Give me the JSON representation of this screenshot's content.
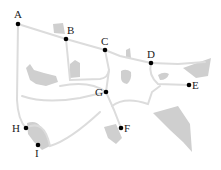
{
  "diagram": {
    "type": "road-network-map",
    "colors": {
      "road": "#dcdcdc",
      "region": "#cfcfcf",
      "node": "#000000",
      "label": "#222222",
      "background": "#ffffff"
    },
    "nodes": [
      {
        "id": "A",
        "label": "A",
        "x": 18,
        "y": 24
      },
      {
        "id": "B",
        "label": "B",
        "x": 66,
        "y": 39
      },
      {
        "id": "C",
        "label": "C",
        "x": 105,
        "y": 50
      },
      {
        "id": "D",
        "label": "D",
        "x": 151,
        "y": 63
      },
      {
        "id": "E",
        "label": "E",
        "x": 189,
        "y": 85
      },
      {
        "id": "F",
        "label": "F",
        "x": 121,
        "y": 128
      },
      {
        "id": "G",
        "label": "G",
        "x": 106,
        "y": 92
      },
      {
        "id": "H",
        "label": "H",
        "x": 26,
        "y": 128
      },
      {
        "id": "I",
        "label": "I",
        "x": 38,
        "y": 145
      }
    ]
  }
}
